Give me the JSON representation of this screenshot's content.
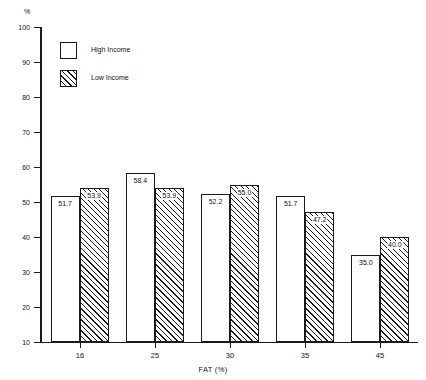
{
  "chart_data": {
    "type": "bar",
    "title": "",
    "xlabel": "FAT (%)",
    "ylabel": "%",
    "categories": [
      "16",
      "25",
      "30",
      "35",
      "45"
    ],
    "series": [
      {
        "name": "High Income",
        "pattern": "open",
        "values": [
          51.7,
          58.4,
          52.2,
          51.7,
          35.0
        ],
        "labels": [
          "51.7",
          "58.4",
          "52.2",
          "51.7",
          "35.0"
        ]
      },
      {
        "name": "Low Income",
        "pattern": "hatched",
        "values": [
          53.9,
          53.9,
          55.0,
          47.2,
          40.0
        ],
        "labels": [
          "53.9",
          "53.9",
          "55.0",
          "47.2",
          "40.0"
        ]
      }
    ],
    "ylim": [
      10,
      100
    ],
    "y_ticks": [
      100,
      90,
      80,
      70,
      60,
      50,
      40,
      30,
      20,
      10
    ],
    "y_tick_labels": [
      "100",
      "90",
      "80",
      "70",
      "60",
      "50",
      "40",
      "30",
      "20",
      "10"
    ],
    "grid": false,
    "legend_position": "top-left"
  },
  "legend": {
    "entries": [
      {
        "label": "High Income"
      },
      {
        "label": "Low Income"
      }
    ]
  },
  "colors": {
    "ink": "#1a1a1a",
    "background": "#ffffff"
  }
}
